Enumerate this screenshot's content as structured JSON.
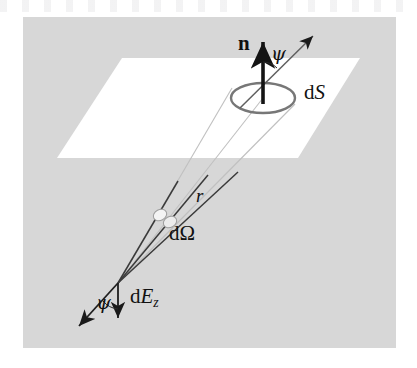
{
  "figure": {
    "kind": "physics-diagram",
    "panel": {
      "background_color": "#d7d7d7",
      "x": 23,
      "y": 17,
      "width": 373,
      "height": 331
    },
    "page_background_color": "#ffffff",
    "ink_color": "#1a1a1a",
    "plane": {
      "name": "surface-plane",
      "fill_color": "#ffffff",
      "points": "122,58 360,58 298,158 57,158"
    },
    "patch": {
      "name": "dS-ellipse",
      "stroke_color": "#7a7a7a",
      "cx": 263,
      "cy": 98,
      "rx": 32,
      "ry": 15
    },
    "cone": {
      "apex_x": 118,
      "apex_y": 283,
      "rays": [
        {
          "name": "ray-left",
          "x2": 232,
          "y2": 88
        },
        {
          "name": "ray-center",
          "x2": 263,
          "y2": 98
        },
        {
          "name": "ray-right",
          "x2": 295,
          "y2": 104
        }
      ],
      "dark_color": "#3c3c3c",
      "light_color": "#b9b9b9"
    },
    "solid_angle_patch": {
      "name": "dOmega-patch",
      "fill_color": "#f2f2f2",
      "stroke_color": "#9a9a9a"
    }
  },
  "labels": {
    "normal_vector": "n",
    "psi_top": "ψ",
    "psi_bottom": "ψ",
    "surface_element_d": "d",
    "surface_element_S": "S",
    "solid_angle_d": "d",
    "solid_angle_omega": "Ω",
    "distance_r": "r",
    "irradiance_d": "d",
    "irradiance_E": "E",
    "irradiance_sub": "z"
  }
}
